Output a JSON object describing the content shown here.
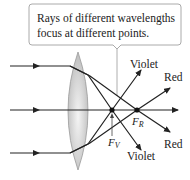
{
  "callout": {
    "line1": "Rays of different wavelengths",
    "line2": "focus at different points."
  },
  "labels": {
    "violet_top": "Violet",
    "violet_bottom": "Violet",
    "red_top": "Red",
    "red_bottom": "Red",
    "fv_main": "F",
    "fv_sub": "V",
    "fr_main": "F",
    "fr_sub": "R"
  },
  "colors": {
    "ray": "#222222",
    "lens_fill": "#c8c8c8",
    "lens_edge": "#9a9a9a",
    "callout_border": "#aaaaaa"
  }
}
